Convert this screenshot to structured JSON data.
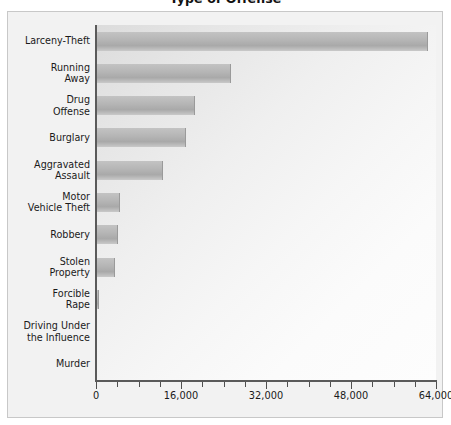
{
  "chart_data": {
    "type": "bar",
    "orientation": "horizontal",
    "title": "Type of Offense",
    "xlabel": "",
    "ylabel": "",
    "xlim": [
      0,
      64000
    ],
    "xticks": [
      0,
      16000,
      32000,
      48000,
      64000
    ],
    "xtick_labels": [
      "0",
      "16,000",
      "32,000",
      "48,000",
      "64,000"
    ],
    "minor_tick_interval": 4000,
    "grid": false,
    "legend": null,
    "categories": [
      "Larceny-Theft",
      "Running\nAway",
      "Drug\nOffense",
      "Burglary",
      "Aggravated\nAssault",
      "Motor\nVehicle Theft",
      "Robbery",
      "Stolen\nProperty",
      "Forcible\nRape",
      "Driving Under\nthe Influence",
      "Murder"
    ],
    "values": [
      62300,
      25200,
      18400,
      16800,
      12400,
      4300,
      4000,
      3400,
      300,
      200,
      100
    ],
    "bar_color": "#b3b3b3",
    "plot_bg_gradient": [
      "#dcdcdc",
      "#fdfdfd"
    ],
    "frame_color": "#c8c8c8",
    "axis_color": "#5a5a5a",
    "text_color": "#1a1a1a"
  }
}
